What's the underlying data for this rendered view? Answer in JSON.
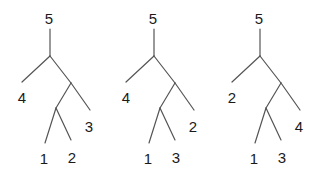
{
  "colors": {
    "edge": "#555555",
    "label": "#1a1a1a",
    "background": "#ffffff"
  },
  "trees": [
    {
      "offset_x": 0,
      "labels": {
        "root": "5",
        "outer_leaf": "4",
        "mid_leaf": "3",
        "inner_left": "1",
        "inner_right": "2"
      }
    },
    {
      "offset_x": 104,
      "labels": {
        "root": "5",
        "outer_leaf": "4",
        "mid_leaf": "2",
        "inner_left": "1",
        "inner_right": "3"
      }
    },
    {
      "offset_x": 210,
      "labels": {
        "root": "5",
        "outer_leaf": "2",
        "mid_leaf": "4",
        "inner_left": "1",
        "inner_right": "3"
      }
    }
  ]
}
